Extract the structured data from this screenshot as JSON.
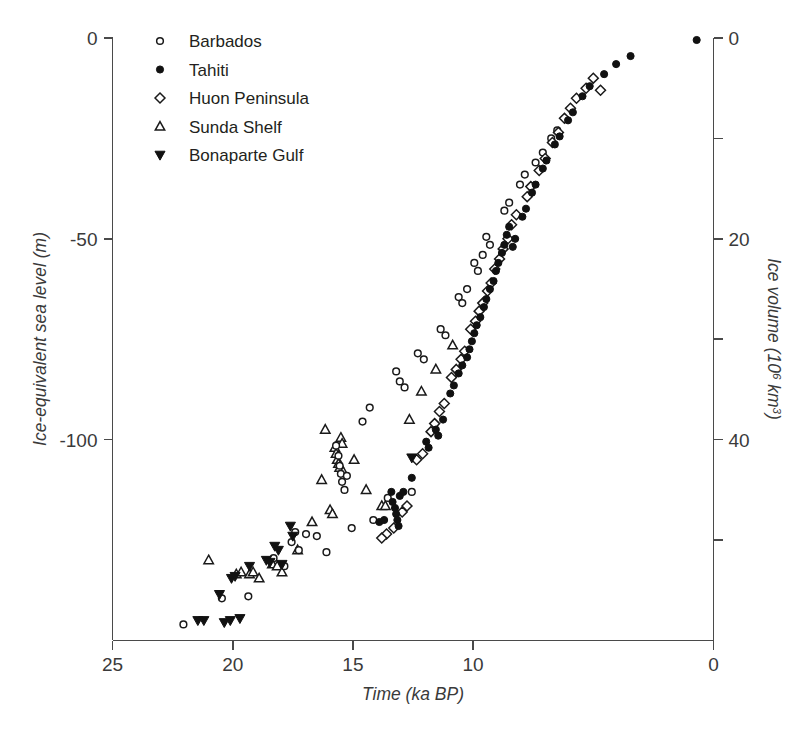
{
  "figure": {
    "background": "#ffffff",
    "marker_stroke": "#1a1a1a",
    "marker_fill": "#111111",
    "axis_color": "#4a4a4a"
  },
  "axes": {
    "x": {
      "label": "Time (ka BP)",
      "ticks": [
        "25",
        "20",
        "15",
        "10",
        "0"
      ],
      "tick_values": [
        25,
        20,
        15,
        10,
        0
      ],
      "range": [
        25,
        0
      ],
      "reversed": true
    },
    "y_left": {
      "label": "Ice-equivalent sea level (m)",
      "ticks": [
        "0",
        "-50",
        "-100"
      ],
      "tick_values": [
        0,
        -50,
        -100
      ],
      "range": [
        -150,
        0
      ]
    },
    "y_right": {
      "label_prefix": "Ice volume (10",
      "label_sup1": "6",
      "label_mid": " km",
      "label_sup2": "3",
      "label_suffix": ")",
      "label": "Ice volume (10^6 km^3)",
      "ticks": [
        "0",
        "20",
        "40"
      ],
      "tick_values": [
        0,
        20,
        40
      ],
      "minor_tick_values": [
        10,
        30,
        50
      ],
      "range": [
        60,
        0
      ]
    }
  },
  "legend": {
    "items": [
      {
        "label": "Barbados",
        "marker": "circle-open"
      },
      {
        "label": "Tahiti",
        "marker": "circle-filled"
      },
      {
        "label": "Huon Peninsula",
        "marker": "diamond-open"
      },
      {
        "label": "Sunda Shelf",
        "marker": "triangle-up-open"
      },
      {
        "label": "Bonaparte Gulf",
        "marker": "triangle-down-filled"
      }
    ]
  },
  "chart_data": {
    "type": "scatter",
    "title": "",
    "xlabel": "Time (ka BP)",
    "ylabel": "Ice-equivalent sea level (m)",
    "ylabel_right": "Ice volume (10^6 km^3)",
    "xlim": [
      25,
      0
    ],
    "ylim": [
      -150,
      0
    ],
    "ylim_right": [
      60,
      0
    ],
    "grid": false,
    "legend_position": "top-left",
    "series": [
      {
        "name": "Barbados",
        "marker": "circle-open",
        "points": [
          [
            22.05,
            -146.0
          ],
          [
            20.45,
            -139.5
          ],
          [
            19.35,
            -139.0
          ],
          [
            18.3,
            -129.5
          ],
          [
            17.85,
            -131.5
          ],
          [
            17.55,
            -125.5
          ],
          [
            17.25,
            -127.5
          ],
          [
            17.4,
            -123.0
          ],
          [
            16.95,
            -123.5
          ],
          [
            16.5,
            -124.0
          ],
          [
            16.1,
            -128.0
          ],
          [
            15.05,
            -122.0
          ],
          [
            14.15,
            -120.0
          ],
          [
            13.55,
            -114.5
          ],
          [
            12.55,
            -113.0
          ],
          [
            15.7,
            -101.5
          ],
          [
            15.6,
            -104.0
          ],
          [
            15.55,
            -106.5
          ],
          [
            15.5,
            -108.5
          ],
          [
            15.45,
            -110.5
          ],
          [
            15.35,
            -112.5
          ],
          [
            15.25,
            -109.0
          ],
          [
            14.6,
            -95.5
          ],
          [
            14.3,
            -92.0
          ],
          [
            13.2,
            -83.0
          ],
          [
            13.05,
            -85.5
          ],
          [
            12.85,
            -87.0
          ],
          [
            12.3,
            -78.5
          ],
          [
            12.05,
            -80.0
          ],
          [
            11.35,
            -72.5
          ],
          [
            11.15,
            -74.0
          ],
          [
            10.6,
            -64.5
          ],
          [
            10.45,
            -66.0
          ],
          [
            10.25,
            -62.5
          ],
          [
            9.95,
            -56.0
          ],
          [
            9.8,
            -58.0
          ],
          [
            9.6,
            -54.0
          ],
          [
            9.45,
            -49.5
          ],
          [
            9.3,
            -51.5
          ],
          [
            8.7,
            -43.0
          ],
          [
            8.5,
            -41.0
          ],
          [
            8.05,
            -36.5
          ],
          [
            7.85,
            -34.0
          ],
          [
            7.4,
            -31.0
          ],
          [
            7.1,
            -28.5
          ],
          [
            6.75,
            -25.0
          ],
          [
            6.5,
            -23.0
          ]
        ]
      },
      {
        "name": "Tahiti",
        "marker": "circle-filled",
        "points": [
          [
            13.9,
            -120.5
          ],
          [
            13.7,
            -120.0
          ],
          [
            13.05,
            -114.0
          ],
          [
            12.9,
            -113.0
          ],
          [
            13.35,
            -115.5
          ],
          [
            13.25,
            -117.0
          ],
          [
            13.2,
            -118.5
          ],
          [
            13.15,
            -120.0
          ],
          [
            13.1,
            -121.5
          ],
          [
            13.4,
            -113.0
          ],
          [
            12.55,
            -109.5
          ],
          [
            11.95,
            -100.5
          ],
          [
            11.85,
            -102.0
          ],
          [
            11.55,
            -97.5
          ],
          [
            11.45,
            -99.0
          ],
          [
            11.25,
            -95.0
          ],
          [
            10.95,
            -88.5
          ],
          [
            10.8,
            -86.5
          ],
          [
            10.6,
            -83.5
          ],
          [
            10.45,
            -81.5
          ],
          [
            10.25,
            -79.5
          ],
          [
            10.15,
            -77.5
          ],
          [
            10.05,
            -75.5
          ],
          [
            9.95,
            -73.5
          ],
          [
            9.85,
            -71.5
          ],
          [
            9.7,
            -69.5
          ],
          [
            9.55,
            -67.0
          ],
          [
            9.45,
            -65.0
          ],
          [
            9.3,
            -62.5
          ],
          [
            9.15,
            -60.5
          ],
          [
            9.05,
            -58.0
          ],
          [
            8.95,
            -56.0
          ],
          [
            8.8,
            -53.5
          ],
          [
            8.7,
            -51.5
          ],
          [
            8.6,
            -49.0
          ],
          [
            8.5,
            -47.0
          ],
          [
            8.35,
            -52.0
          ],
          [
            8.25,
            -50.0
          ],
          [
            7.95,
            -44.5
          ],
          [
            7.8,
            -42.5
          ],
          [
            7.55,
            -38.5
          ],
          [
            7.4,
            -36.5
          ],
          [
            7.1,
            -32.5
          ],
          [
            6.95,
            -30.5
          ],
          [
            6.6,
            -26.5
          ],
          [
            6.4,
            -24.5
          ],
          [
            6.05,
            -20.5
          ],
          [
            5.85,
            -18.5
          ],
          [
            5.45,
            -14.5
          ],
          [
            5.15,
            -12.0
          ],
          [
            4.55,
            -9.0
          ],
          [
            4.05,
            -6.5
          ],
          [
            3.45,
            -4.5
          ],
          [
            0.7,
            -0.5
          ]
        ]
      },
      {
        "name": "Huon Peninsula",
        "marker": "diamond-open",
        "points": [
          [
            13.6,
            -123.5
          ],
          [
            13.3,
            -122.0
          ],
          [
            12.95,
            -118.0
          ],
          [
            12.75,
            -116.5
          ],
          [
            13.8,
            -124.5
          ],
          [
            12.35,
            -105.0
          ],
          [
            12.1,
            -103.5
          ],
          [
            11.75,
            -98.0
          ],
          [
            11.6,
            -96.0
          ],
          [
            11.4,
            -93.0
          ],
          [
            11.2,
            -91.0
          ],
          [
            10.9,
            -84.5
          ],
          [
            10.7,
            -82.5
          ],
          [
            10.5,
            -80.0
          ],
          [
            10.35,
            -78.0
          ],
          [
            10.1,
            -72.5
          ],
          [
            9.9,
            -70.5
          ],
          [
            9.75,
            -68.0
          ],
          [
            9.6,
            -66.0
          ],
          [
            9.4,
            -63.0
          ],
          [
            9.25,
            -61.0
          ],
          [
            9.1,
            -57.5
          ],
          [
            8.9,
            -55.0
          ],
          [
            8.75,
            -52.5
          ],
          [
            8.55,
            -50.0
          ],
          [
            8.4,
            -46.5
          ],
          [
            8.2,
            -44.0
          ],
          [
            7.75,
            -39.5
          ],
          [
            7.6,
            -37.0
          ],
          [
            7.25,
            -33.0
          ],
          [
            7.0,
            -30.0
          ],
          [
            6.7,
            -26.0
          ],
          [
            6.45,
            -23.5
          ],
          [
            6.2,
            -20.0
          ],
          [
            5.95,
            -17.5
          ],
          [
            5.7,
            -15.0
          ],
          [
            5.3,
            -12.5
          ],
          [
            5.0,
            -10.0
          ],
          [
            4.7,
            -13.0
          ]
        ]
      },
      {
        "name": "Sunda Shelf",
        "marker": "triangle-up-open",
        "points": [
          [
            21.0,
            -130.0
          ],
          [
            19.85,
            -133.5
          ],
          [
            19.65,
            -133.0
          ],
          [
            19.3,
            -133.5
          ],
          [
            19.15,
            -133.0
          ],
          [
            18.9,
            -134.5
          ],
          [
            18.35,
            -131.0
          ],
          [
            18.15,
            -131.5
          ],
          [
            17.95,
            -133.0
          ],
          [
            17.3,
            -127.5
          ],
          [
            16.7,
            -120.5
          ],
          [
            15.95,
            -117.5
          ],
          [
            15.85,
            -118.5
          ],
          [
            15.75,
            -102.0
          ],
          [
            15.7,
            -103.5
          ],
          [
            15.65,
            -105.0
          ],
          [
            15.6,
            -106.0
          ],
          [
            15.55,
            -107.0
          ],
          [
            15.5,
            -99.5
          ],
          [
            15.45,
            -101.0
          ],
          [
            15.4,
            -108.0
          ],
          [
            16.15,
            -97.5
          ],
          [
            16.3,
            -110.0
          ],
          [
            14.45,
            -112.5
          ],
          [
            13.8,
            -116.5
          ],
          [
            13.65,
            -116.5
          ],
          [
            14.95,
            -105.0
          ],
          [
            12.65,
            -95.0
          ],
          [
            12.15,
            -88.0
          ],
          [
            11.55,
            -82.5
          ],
          [
            10.85,
            -76.5
          ]
        ]
      },
      {
        "name": "Bonaparte Gulf",
        "marker": "triangle-down-filled",
        "points": [
          [
            21.45,
            -145.0
          ],
          [
            21.2,
            -145.0
          ],
          [
            20.35,
            -145.5
          ],
          [
            20.1,
            -145.0
          ],
          [
            19.7,
            -144.5
          ],
          [
            20.55,
            -138.5
          ],
          [
            20.05,
            -134.5
          ],
          [
            19.9,
            -134.0
          ],
          [
            19.3,
            -131.5
          ],
          [
            18.6,
            -130.0
          ],
          [
            18.45,
            -130.5
          ],
          [
            18.25,
            -126.5
          ],
          [
            18.1,
            -127.5
          ],
          [
            17.6,
            -121.5
          ],
          [
            17.5,
            -124.0
          ],
          [
            17.95,
            -131.0
          ],
          [
            12.55,
            -104.5
          ]
        ]
      }
    ]
  }
}
